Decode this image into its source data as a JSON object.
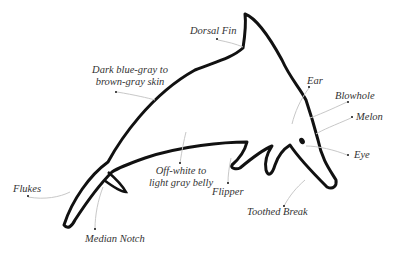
{
  "diagram": {
    "colors": {
      "outline": "#111111",
      "leader": "#c8c8c8",
      "text": "#333333"
    },
    "labels": [
      {
        "id": "dorsal-fin",
        "text": "Dorsal Fin"
      },
      {
        "id": "skin",
        "line1": "Dark blue-gray to",
        "line2": "brown-gray skin"
      },
      {
        "id": "ear",
        "text": "Ear"
      },
      {
        "id": "blowhole",
        "text": "Blowhole"
      },
      {
        "id": "melon",
        "text": "Melon"
      },
      {
        "id": "eye",
        "text": "Eye"
      },
      {
        "id": "belly",
        "line1": "Off-white to",
        "line2": "light gray belly"
      },
      {
        "id": "flipper",
        "text": "Flipper"
      },
      {
        "id": "toothed-break",
        "text": "Toothed Break"
      },
      {
        "id": "flukes",
        "text": "Flukes"
      },
      {
        "id": "median-notch",
        "text": "Median Notch"
      }
    ]
  }
}
